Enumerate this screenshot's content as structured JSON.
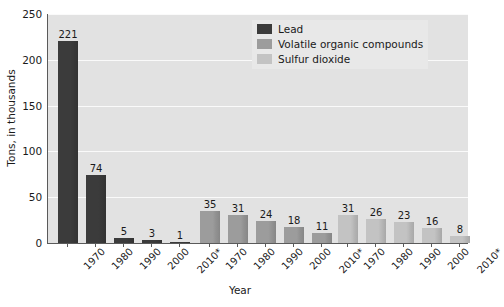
{
  "chart_data": {
    "type": "bar",
    "title": "",
    "xlabel": "Year",
    "ylabel": "Tons, in thousands",
    "categories": [
      "1970",
      "1980",
      "1990",
      "2000",
      "2010*"
    ],
    "ylim": [
      0,
      250
    ],
    "yticks": [
      0,
      50,
      100,
      150,
      200,
      250
    ],
    "ytick_labels": [
      "0",
      "50",
      "100",
      "150",
      "200",
      "250"
    ],
    "grid": true,
    "legend_position": "top-right",
    "grouping": "series-clustered-separately",
    "series": [
      {
        "name": "Lead",
        "color": "#3b3b3b",
        "values": [
          221,
          74,
          5,
          3,
          1
        ],
        "labels": [
          "221",
          "74",
          "5",
          "3",
          "1"
        ]
      },
      {
        "name": "Volatile organic compounds",
        "color": "#9c9c9c",
        "values": [
          35,
          31,
          24,
          18,
          11
        ],
        "labels": [
          "35",
          "31",
          "24",
          "18",
          "11"
        ]
      },
      {
        "name": "Sulfur dioxide",
        "color": "#c3c3c3",
        "values": [
          31,
          26,
          23,
          16,
          8
        ],
        "labels": [
          "31",
          "26",
          "23",
          "16",
          "8"
        ]
      }
    ]
  },
  "axes": {
    "y_title": "Tons, in thousands",
    "x_title": "Year",
    "y_ticks": [
      "250",
      "200",
      "150",
      "100",
      "50",
      "0"
    ]
  },
  "legend": {
    "items": [
      {
        "label": "Lead",
        "color": "#3b3b3b"
      },
      {
        "label": "Volatile organic compounds",
        "color": "#9c9c9c"
      },
      {
        "label": "Sulfur dioxide",
        "color": "#c3c3c3"
      }
    ]
  },
  "colors": {
    "plot_background": "#e2e2e2",
    "gridline": "#fafafa",
    "axis": "#5a5a5a",
    "text": "#1a1a1a",
    "legend_background": "#e8e8e8"
  }
}
